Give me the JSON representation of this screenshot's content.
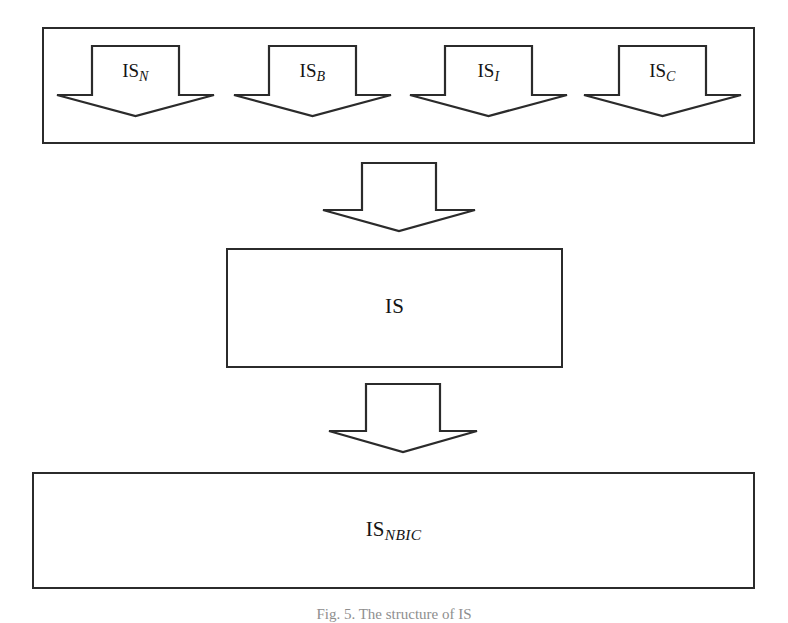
{
  "figure": {
    "caption": "Fig. 5. The structure of IS",
    "colors": {
      "stroke": "#2b2b2b",
      "fill": "#ffffff",
      "text": "#141414",
      "background": "#ffffff"
    }
  },
  "group": {
    "name": "component-information-systems-group",
    "arrows": [
      {
        "base": "IS",
        "subscript": "N",
        "full_label": "IS_N"
      },
      {
        "base": "IS",
        "subscript": "B",
        "full_label": "IS_B"
      },
      {
        "base": "IS",
        "subscript": "I",
        "full_label": "IS_I"
      },
      {
        "base": "IS",
        "subscript": "C",
        "full_label": "IS_C"
      }
    ]
  },
  "connectors": {
    "group_to_is": {
      "direction": "down",
      "label": ""
    },
    "is_to_isnbic": {
      "direction": "down",
      "label": ""
    }
  },
  "boxes": {
    "is": {
      "base": "IS",
      "subscript": "",
      "full_label": "IS"
    },
    "isnbic": {
      "base": "IS",
      "subscript": "NBIC",
      "full_label": "IS_NBIC"
    }
  }
}
